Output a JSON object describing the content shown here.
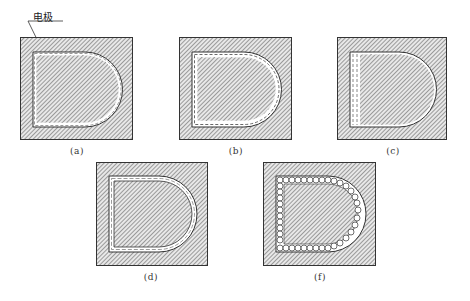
{
  "figure": {
    "annotation": {
      "label": "电极",
      "target": "electrode"
    },
    "panels": [
      {
        "id": "a",
        "caption": "(a)",
        "variant": "dashed-offset-gap"
      },
      {
        "id": "b",
        "caption": "(b)",
        "variant": "double-dashed"
      },
      {
        "id": "c",
        "caption": "(c)",
        "variant": "left-band-dashed"
      },
      {
        "id": "d",
        "caption": "(d)",
        "variant": "single-gap-dashed"
      },
      {
        "id": "f",
        "caption": "(f)",
        "variant": "circles-ring"
      }
    ],
    "colors": {
      "hatch_line": "#555555",
      "hatch_bg": "#e6e6e6",
      "outline": "#333333",
      "gap": "#ffffff"
    }
  }
}
